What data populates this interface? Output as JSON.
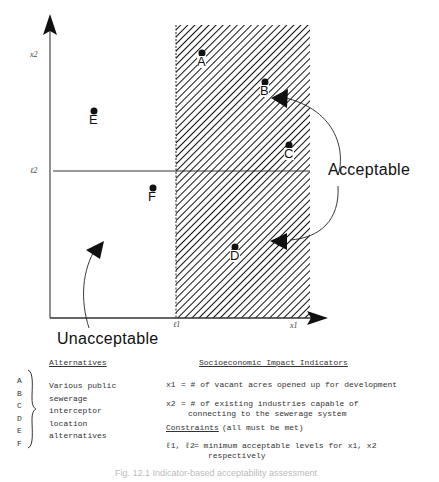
{
  "diagram": {
    "axes": {
      "x_label": "x1",
      "y_label": "x2",
      "x_threshold_label": "ℓ1",
      "y_threshold_label": "ℓ2"
    },
    "points": [
      {
        "label": "A",
        "x": 202,
        "y": 53
      },
      {
        "label": "B",
        "x": 265,
        "y": 82
      },
      {
        "label": "C",
        "x": 289,
        "y": 145
      },
      {
        "label": "D",
        "x": 235,
        "y": 247
      },
      {
        "label": "E",
        "x": 94,
        "y": 111
      },
      {
        "label": "F",
        "x": 153,
        "y": 188
      }
    ],
    "regions": {
      "acceptable_label": "Acceptable",
      "unacceptable_label": "Unacceptable"
    }
  },
  "legend": {
    "alternatives": {
      "heading": "Alternatives",
      "letters": [
        "A",
        "B",
        "C",
        "D",
        "E",
        "F"
      ],
      "description_lines": [
        "Various public",
        "sewerage",
        "interceptor",
        "location",
        "alternatives"
      ]
    },
    "indicators": {
      "heading": "Socioeconomic Impact Indicators",
      "x1_symbol": "x1",
      "x1_def": "= # of vacant acres opened up for development",
      "x2_symbol": "x2",
      "x2_def_line1": "= # of existing industries capable of",
      "x2_def_line2": "connecting to the sewerage system"
    },
    "constraints": {
      "heading": "Constraints",
      "note": "(all must be met)",
      "symbols": "ℓ1, ℓ2",
      "def_line1": "= minimum acceptable levels for x1, x2",
      "def_line2": "respectively"
    }
  },
  "caption": "Fig. 12.1 Indicator-based acceptability assessment"
}
